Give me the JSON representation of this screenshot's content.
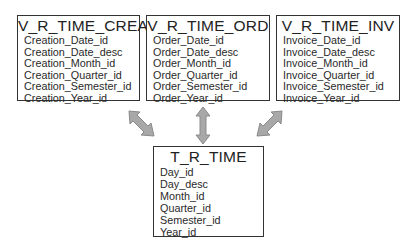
{
  "entities": {
    "creation": {
      "title": "V_R_TIME_CREA",
      "fields": [
        "Creation_Date_id",
        "Creation_Date_desc",
        "Creation_Month_id",
        "Creation_Quarter_id",
        "Creation_Semester_id",
        "Creation_Year_id"
      ]
    },
    "order": {
      "title": "V_R_TIME_ORD",
      "fields": [
        "Order_Date_id",
        "Order_Date_desc",
        "Order_Month_id",
        "Order_Quarter_id",
        "Order_Semester_id",
        "Order_Year_id"
      ]
    },
    "invoice": {
      "title": "V_R_TIME_INV",
      "fields": [
        "Invoice_Date_id",
        "Invoice_Date_desc",
        "Invoice_Month_id",
        "Invoice_Quarter_id",
        "Invoice_Semester_id",
        "Invoice_Year_id"
      ]
    },
    "time": {
      "title": "T_R_TIME",
      "fields": [
        "Day_id",
        "Day_desc",
        "Month_id",
        "Quarter_id",
        "Semester_id",
        "Year_id"
      ]
    }
  },
  "relationships": [
    {
      "from": "V_R_TIME_CREA",
      "to": "T_R_TIME",
      "type": "bidirectional"
    },
    {
      "from": "V_R_TIME_ORD",
      "to": "T_R_TIME",
      "type": "bidirectional"
    },
    {
      "from": "V_R_TIME_INV",
      "to": "T_R_TIME",
      "type": "bidirectional"
    }
  ],
  "colors": {
    "arrow_fill": "#a8a8a8",
    "arrow_stroke": "#8a8a8a",
    "box_border": "#333333"
  }
}
